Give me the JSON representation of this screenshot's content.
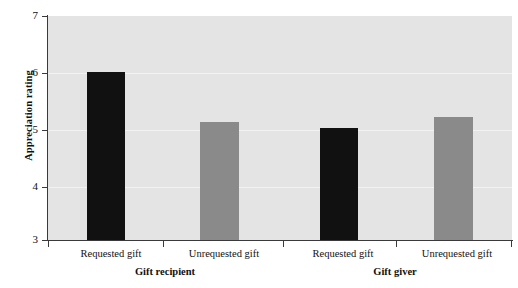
{
  "chart_data": {
    "type": "bar",
    "title": "",
    "subtitle": "",
    "xlabel": "",
    "ylabel": "Appreciation rating",
    "ylim": [
      3,
      7
    ],
    "yticks": [
      3,
      4,
      5,
      6,
      7
    ],
    "ytick_labels": [
      "3",
      "4",
      "5",
      "6",
      "7"
    ],
    "grid": true,
    "legend": "none",
    "categories": [
      "Requested gift",
      "Unrequested gift",
      "Requested gift",
      "Unrequested gift"
    ],
    "groups": [
      {
        "label": "Gift recipient",
        "categories": [
          "Requested gift",
          "Unrequested gift"
        ],
        "values": [
          6.0,
          5.1
        ],
        "colors": [
          "#111111",
          "#8a8a8a"
        ]
      },
      {
        "label": "Gift giver",
        "categories": [
          "Requested gift",
          "Unrequested gift"
        ],
        "values": [
          5.0,
          5.2
        ],
        "colors": [
          "#111111",
          "#8a8a8a"
        ]
      }
    ],
    "values": [
      6.0,
      5.1,
      5.0,
      5.2
    ],
    "bar_colors": [
      "#111111",
      "#8a8a8a",
      "#111111",
      "#8a8a8a"
    ],
    "plot_background": "#e4e4e4",
    "figure_background": "#ffffff",
    "axis_color": "#3a3a3a",
    "gridline_color": "#f2f2f2"
  },
  "axis": {
    "y_title": "Appreciation rating",
    "ticks": {
      "t7": "7",
      "t6": "6",
      "t5": "5",
      "t4": "4",
      "t3": "3"
    }
  },
  "x_labels": {
    "b0": "Requested gift",
    "b1": "Unrequested gift",
    "b2": "Requested gift",
    "b3": "Unrequested gift"
  },
  "group_labels": {
    "g0": "Gift recipient",
    "g1": "Gift giver"
  }
}
